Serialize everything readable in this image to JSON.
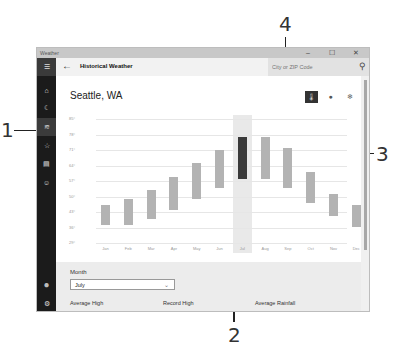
{
  "callouts": [
    {
      "num": "1",
      "label": "navigation-pane-callout"
    },
    {
      "num": "2",
      "label": "selected-month-callout"
    },
    {
      "num": "3",
      "label": "scrollbar-callout"
    },
    {
      "num": "4",
      "label": "search-box-callout"
    }
  ],
  "window": {
    "title": "Weather",
    "controls": {
      "minimize": "–",
      "maximize": "☐",
      "close": "✕"
    }
  },
  "header": {
    "back_icon": "←",
    "title": "Historical Weather",
    "search_placeholder": "City or ZIP Code",
    "search_icon": "⚲"
  },
  "sidebar": {
    "items": [
      {
        "name": "menu",
        "icon": "☰"
      },
      {
        "name": "forecast",
        "icon": "⌂"
      },
      {
        "name": "maps",
        "icon": "☾"
      },
      {
        "name": "historical-weather",
        "icon": "≋"
      },
      {
        "name": "places",
        "icon": "☆"
      },
      {
        "name": "news",
        "icon": "▤"
      },
      {
        "name": "send-feedback",
        "icon": "☺"
      },
      {
        "name": "account",
        "icon": "●"
      },
      {
        "name": "settings",
        "icon": "⚙"
      }
    ]
  },
  "main": {
    "city": "Seattle, WA",
    "toggles": [
      {
        "name": "temperature",
        "icon": "🌡",
        "selected": true
      },
      {
        "name": "rainfall",
        "icon": "●",
        "selected": false
      },
      {
        "name": "snowfall",
        "icon": "❄",
        "selected": false
      }
    ],
    "month_label": "Month",
    "month_value": "July",
    "chevron": "⌄",
    "stats": [
      "Average High",
      "Record High",
      "Average Rainfall"
    ]
  },
  "chart_data": {
    "type": "bar",
    "title": "",
    "xlabel": "",
    "ylabel": "",
    "yticks": [
      "85°",
      "78°",
      "71°",
      "64°",
      "57°",
      "50°",
      "43°",
      "36°",
      "29°"
    ],
    "ylim": [
      29,
      85
    ],
    "grid": true,
    "categories": [
      "Jan",
      "Feb",
      "Mar",
      "Apr",
      "May",
      "Jun",
      "Jul",
      "Aug",
      "Sep",
      "Oct",
      "Nov",
      "Dec"
    ],
    "series": [
      {
        "name": "Average Low",
        "values": [
          37,
          37,
          40,
          44,
          49,
          54,
          58,
          58,
          54,
          47,
          41,
          36
        ]
      },
      {
        "name": "Average High",
        "values": [
          46,
          49,
          53,
          59,
          65,
          71,
          77,
          77,
          72,
          61,
          51,
          46
        ]
      }
    ],
    "selected_category": "Jul",
    "colors": {
      "bar": "#b3b3b3",
      "selected": "#3a3a3a",
      "highlight": "#e9e9e9"
    }
  }
}
